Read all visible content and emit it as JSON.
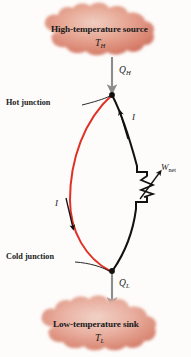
{
  "figure": {
    "type": "thermoelectric-power-generator-diagram",
    "background_color": "#fdfcfa"
  },
  "source": {
    "title": "High-temperature source",
    "symbol": "T",
    "symbol_subscript": "H",
    "cloud_color": "#d9715e"
  },
  "sink": {
    "title": "Low-temperature sink",
    "symbol": "T",
    "symbol_subscript": "L",
    "cloud_color": "#d9715e"
  },
  "heat_in": {
    "symbol": "Q",
    "symbol_subscript": "H",
    "arrow_color": "#8c8c8c",
    "arrow_direction": "down"
  },
  "heat_out": {
    "symbol": "Q",
    "symbol_subscript": "L",
    "arrow_color": "#8c8c8c",
    "arrow_direction": "down"
  },
  "junctions": {
    "hot_label": "Hot junction",
    "cold_label": "Cold junction",
    "node_color": "#111111"
  },
  "wires": {
    "left_color": "#e03127",
    "right_color": "#111111"
  },
  "current": {
    "left_symbol": "I",
    "left_direction": "down",
    "right_symbol": "I",
    "right_direction": "up"
  },
  "load": {
    "symbol": "W",
    "symbol_subscript": "net",
    "component": "variable-resistor"
  }
}
